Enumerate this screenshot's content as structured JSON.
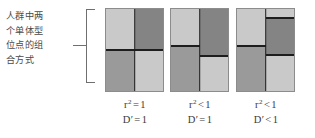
{
  "figure": {
    "caption": "人群中两\n个单体型\n位点的组\n合方式",
    "bracket_name": "grouping-bracket",
    "colors": {
      "light": "#c9c9c9",
      "dark": "#848484",
      "mid": "#9a9a9a",
      "divider": "#1d1d1d",
      "outline": "#8c8c8c",
      "text": "#3a3a3a",
      "caption_text": "#4a4a4a"
    },
    "blocks": [
      {
        "id": "block-1",
        "name": "haplotype-block-1",
        "left_column": [
          {
            "shade": "light",
            "fraction": 50
          },
          {
            "shade": "mid",
            "fraction": 50
          }
        ],
        "right_column": [
          {
            "shade": "dark",
            "fraction": 50
          },
          {
            "shade": "light",
            "fraction": 50
          }
        ]
      },
      {
        "id": "block-2",
        "name": "haplotype-block-2",
        "left_column": [
          {
            "shade": "light",
            "fraction": 45
          },
          {
            "shade": "mid",
            "fraction": 55
          }
        ],
        "right_column": [
          {
            "shade": "dark",
            "fraction": 57
          },
          {
            "shade": "light",
            "fraction": 43
          }
        ]
      },
      {
        "id": "block-3",
        "name": "haplotype-block-3",
        "left_column": [
          {
            "shade": "light",
            "fraction": 45
          },
          {
            "shade": "mid",
            "fraction": 55
          }
        ],
        "right_column": [
          {
            "shade": "light",
            "fraction": 11
          },
          {
            "shade": "dark",
            "fraction": 45
          },
          {
            "shade": "light",
            "fraction": 44
          }
        ]
      }
    ],
    "labels": [
      {
        "id": "label-1",
        "name": "stat-label-1",
        "r2_symbol": "r",
        "r2_exponent": "2",
        "r2_operator": "=",
        "r2_value": "1",
        "d_symbol": "D′",
        "d_operator": "=",
        "d_value": "1"
      },
      {
        "id": "label-2",
        "name": "stat-label-2",
        "r2_symbol": "r",
        "r2_exponent": "2",
        "r2_operator": "<",
        "r2_value": "1",
        "d_symbol": "D′",
        "d_operator": "=",
        "d_value": "1"
      },
      {
        "id": "label-3",
        "name": "stat-label-3",
        "r2_symbol": "r",
        "r2_exponent": "2",
        "r2_operator": "<",
        "r2_value": "1",
        "d_symbol": "D′",
        "d_operator": "<",
        "d_value": "1"
      }
    ]
  }
}
